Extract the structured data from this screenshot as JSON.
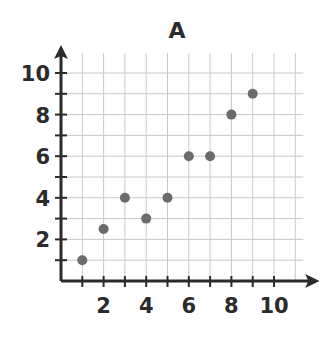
{
  "chart_data": {
    "type": "scatter",
    "title": "A",
    "xlabel": "",
    "ylabel": "",
    "xlim": [
      0,
      10
    ],
    "ylim": [
      0,
      10
    ],
    "x_ticks": [
      2,
      4,
      6,
      8,
      10
    ],
    "y_ticks": [
      2,
      4,
      6,
      8,
      10
    ],
    "grid": true,
    "legend": null,
    "series": [
      {
        "name": "A",
        "color": "#6b6b6b",
        "points": [
          {
            "x": 1,
            "y": 1
          },
          {
            "x": 2,
            "y": 2.5
          },
          {
            "x": 3,
            "y": 4
          },
          {
            "x": 4,
            "y": 3
          },
          {
            "x": 5,
            "y": 4
          },
          {
            "x": 6,
            "y": 6
          },
          {
            "x": 7,
            "y": 6
          },
          {
            "x": 8,
            "y": 8
          },
          {
            "x": 9,
            "y": 9
          }
        ]
      }
    ]
  },
  "colors": {
    "axis": "#2b2b2b",
    "grid": "#c8c8c8",
    "point": "#6b6b6b"
  }
}
